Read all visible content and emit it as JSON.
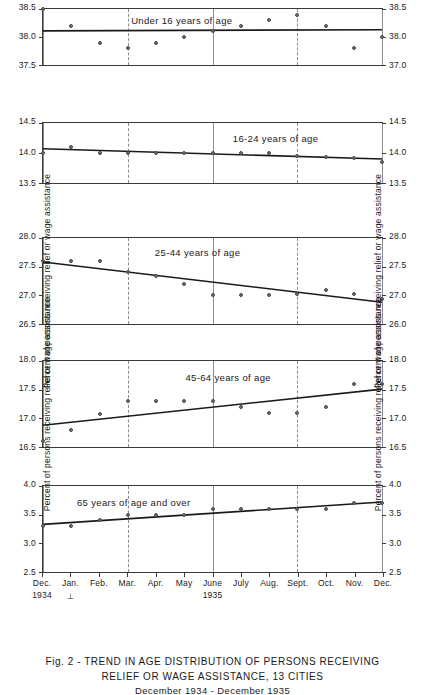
{
  "caption": {
    "line1": "Fig. 2 - TREND IN AGE DISTRIBUTION OF PERSONS RECEIVING",
    "line2": "RELIEF OR WAGE ASSISTANCE, 13 CITIES",
    "line3": "December 1934 - December 1935"
  },
  "axis_titles": {
    "y_left": "Percent of persons receiving relief or wage assistance",
    "y_right": "Percent of persons receiving relief or wage assistance"
  },
  "x_axis": {
    "labels": [
      "Dec.",
      "Jan.",
      "Feb.",
      "Mar.",
      "Apr.",
      "May",
      "June",
      "July",
      "Aug.",
      "Sept.",
      "Oct.",
      "Nov.",
      "Dec."
    ],
    "year_start": "1934",
    "year_mid": "1935",
    "year_mark": "⊥"
  },
  "chart_data": [
    {
      "type": "scatter",
      "title": "Under 16 years of age",
      "xlabel": "",
      "ylabel": "Percent of persons receiving relief or wage assistance",
      "x": [
        "Dec.",
        "Jan.",
        "Feb.",
        "Mar.",
        "Apr.",
        "May",
        "June",
        "July",
        "Aug.",
        "Sept.",
        "Oct.",
        "Nov.",
        "Dec."
      ],
      "values": [
        38.5,
        38.2,
        37.9,
        37.8,
        37.9,
        38.0,
        38.1,
        38.2,
        38.3,
        38.4,
        38.2,
        37.8,
        38.0
      ],
      "trend": [
        38.11,
        38.13
      ],
      "ylim": [
        37.5,
        38.5
      ],
      "yticks_left": [
        "38.5",
        "38.0",
        "37.5"
      ],
      "yticks_right": [
        "38.5",
        "38.0",
        "37.0"
      ],
      "ytick_values": [
        38.5,
        38.0,
        37.5
      ],
      "grid": true,
      "legend": "none"
    },
    {
      "type": "scatter",
      "title": "16-24 years of age",
      "xlabel": "",
      "ylabel": "Percent of persons receiving relief or wage assistance",
      "x": [
        "Dec.",
        "Jan.",
        "Feb.",
        "Mar.",
        "Apr.",
        "May",
        "June",
        "July",
        "Aug.",
        "Sept.",
        "Oct.",
        "Nov.",
        "Dec."
      ],
      "values": [
        14.0,
        14.1,
        14.0,
        14.0,
        14.0,
        14.0,
        14.0,
        14.0,
        14.0,
        13.95,
        13.93,
        13.92,
        13.85
      ],
      "trend": [
        14.07,
        13.9
      ],
      "ylim": [
        13.5,
        14.5
      ],
      "yticks_left": [
        "14.5",
        "14.0",
        "13.5"
      ],
      "yticks_right": [
        "14.5",
        "14.0",
        "13.5"
      ],
      "ytick_values": [
        14.5,
        14.0,
        13.5
      ],
      "grid": true,
      "legend": "none"
    },
    {
      "type": "scatter",
      "title": "25-44 years of age",
      "xlabel": "",
      "ylabel": "Percent of persons receiving relief or wage assistance",
      "x": [
        "Dec.",
        "Jan.",
        "Feb.",
        "Mar.",
        "Apr.",
        "May",
        "June",
        "July",
        "Aug.",
        "Sept.",
        "Oct.",
        "Nov.",
        "Dec."
      ],
      "values": [
        27.6,
        27.6,
        27.6,
        27.4,
        27.33,
        27.2,
        27.0,
        27.0,
        27.0,
        27.02,
        27.1,
        27.02,
        26.93
      ],
      "trend": [
        27.58,
        26.88
      ],
      "ylim": [
        26.5,
        28.0
      ],
      "yticks_left": [
        "28.0",
        "27.5",
        "27.0",
        "26.5"
      ],
      "yticks_right": [
        "28.0",
        "27.5",
        "27.0",
        "26.0"
      ],
      "ytick_values": [
        28.0,
        27.5,
        27.0,
        26.5
      ],
      "grid": true,
      "legend": "none"
    },
    {
      "type": "scatter",
      "title": "45-64 years of age",
      "xlabel": "",
      "ylabel": "Percent of persons receiving relief or wage assistance",
      "x": [
        "Dec.",
        "Jan.",
        "Feb.",
        "Mar.",
        "Apr.",
        "May",
        "June",
        "July",
        "Aug.",
        "Sept.",
        "Oct.",
        "Nov.",
        "Dec."
      ],
      "values": [
        16.6,
        16.8,
        17.07,
        17.3,
        17.3,
        17.3,
        17.3,
        17.2,
        17.1,
        17.1,
        17.2,
        17.6,
        17.6
      ],
      "trend": [
        16.88,
        17.51
      ],
      "ylim": [
        16.5,
        18.0
      ],
      "yticks_left": [
        "18.0",
        "17.5",
        "17.0",
        "16.5"
      ],
      "yticks_right": [
        "18.0",
        "17.5",
        "17.0",
        "16.5"
      ],
      "ytick_values": [
        18.0,
        17.5,
        17.0,
        16.5
      ],
      "grid": true,
      "legend": "none"
    },
    {
      "type": "scatter",
      "title": "65 years of age and over",
      "xlabel": "",
      "ylabel": "Percent of persons receiving relief or wage assistance",
      "x": [
        "Dec.",
        "Jan.",
        "Feb.",
        "Mar.",
        "Apr.",
        "May",
        "June",
        "July",
        "Aug.",
        "Sept.",
        "Oct.",
        "Nov.",
        "Dec."
      ],
      "values": [
        3.3,
        3.3,
        3.4,
        3.5,
        3.5,
        3.5,
        3.6,
        3.6,
        3.6,
        3.6,
        3.6,
        3.7,
        3.7
      ],
      "trend": [
        3.33,
        3.72
      ],
      "ylim": [
        2.5,
        4.0
      ],
      "yticks_left": [
        "4.0",
        "3.5",
        "3.0",
        "2.5"
      ],
      "yticks_right": [
        "4.0",
        "3.5",
        "3.0",
        "2.5"
      ],
      "ytick_values": [
        4.0,
        3.5,
        3.0,
        2.5
      ],
      "grid": true,
      "legend": "none"
    }
  ]
}
